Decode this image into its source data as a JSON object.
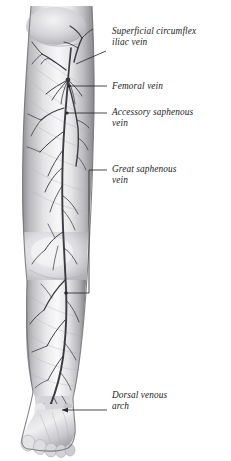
{
  "figure": {
    "view": "anterior view of right lower limb",
    "background_color": "#ffffff",
    "vein_color": "#3b3b42",
    "leader_color": "#2b2b2b",
    "skin_light": "#fbfbfb",
    "skin_mid": "#cfcfcf",
    "skin_shadow": "#8e8e92",
    "skin_deep": "#6d6d72",
    "label_color": "#1d1d1d"
  },
  "labels": [
    {
      "id": "superficial-circumflex-iliac-vein",
      "text": "Superficial circumflex\niliac vein",
      "x": 112,
      "y": 26,
      "leader": {
        "type": "diagonal",
        "points": "106,51 76,64",
        "terminal": "none"
      }
    },
    {
      "id": "femoral-vein",
      "text": "Femoral vein",
      "x": 112,
      "y": 81,
      "leader": {
        "type": "straight",
        "points": "107,86 69,86",
        "terminal": "dot",
        "terminal_point": "69,86"
      }
    },
    {
      "id": "accessory-saphenous-vein",
      "text": "Accessory saphenous\nvein",
      "x": 112,
      "y": 107,
      "leader": {
        "type": "straight",
        "points": "107,113 67,113",
        "terminal": "dot",
        "terminal_point": "67,113"
      }
    },
    {
      "id": "great-saphenous-vein",
      "text": "Great saphenous\nvein",
      "x": 112,
      "y": 164,
      "leader": {
        "type": "elbow",
        "points": "107,170 89,170 89,293 66,293",
        "terminal": "dot",
        "terminal_point": "66,293"
      }
    },
    {
      "id": "dorsal-venous-arch",
      "text": "Dorsal venous\narch",
      "x": 112,
      "y": 390,
      "leader": {
        "type": "straight",
        "points": "107,410 62,410",
        "terminal": "arrow",
        "terminal_point": "62,410"
      }
    }
  ],
  "anatomy": {
    "regions": [
      {
        "name": "inguinal-region",
        "label": "groin / inguinal region"
      },
      {
        "name": "thigh",
        "label": "thigh"
      },
      {
        "name": "knee",
        "label": "knee"
      },
      {
        "name": "leg",
        "label": "leg / calf"
      },
      {
        "name": "ankle",
        "label": "ankle"
      },
      {
        "name": "foot",
        "label": "foot with five toes"
      }
    ],
    "vessels": [
      {
        "name": "great-saphenous-vein",
        "label": "great saphenous vein"
      },
      {
        "name": "accessory-saphenous-vein",
        "label": "accessory saphenous vein"
      },
      {
        "name": "femoral-vein",
        "label": "femoral vein"
      },
      {
        "name": "superficial-circumflex-iliac-vein",
        "label": "superficial circumflex iliac vein"
      },
      {
        "name": "saphenofemoral-junction",
        "label": "saphenofemoral junction"
      },
      {
        "name": "dorsal-venous-arch",
        "label": "dorsal venous arch"
      },
      {
        "name": "tributary-veins",
        "label": "superficial tributary veins"
      }
    ]
  }
}
